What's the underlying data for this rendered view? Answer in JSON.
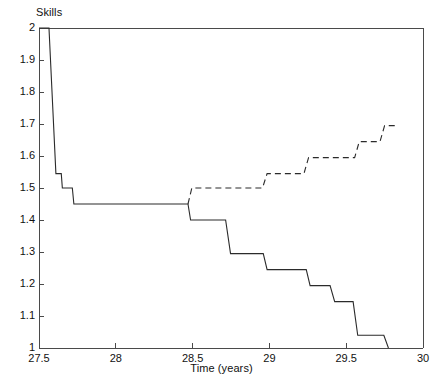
{
  "chart_data": {
    "type": "line",
    "title": "",
    "xlabel": "Time (years)",
    "ylabel": "Skills",
    "xlim": [
      27.5,
      30
    ],
    "ylim": [
      1,
      2
    ],
    "xticks": [
      27.5,
      28,
      28.5,
      29,
      29.5,
      30
    ],
    "xticklabels": [
      "27.5",
      "28",
      "28.5",
      "29",
      "29.5",
      "30"
    ],
    "yticks": [
      1,
      1.1,
      1.2,
      1.3,
      1.4,
      1.5,
      1.6,
      1.7,
      1.8,
      1.9,
      2
    ],
    "yticklabels": [
      "1",
      "1.1",
      "1.2",
      "1.3",
      "1.4",
      "1.5",
      "1.6",
      "1.7",
      "1.8",
      "1.9",
      "2"
    ],
    "grid": false,
    "legend": "none",
    "line_color": "#2b2b2b",
    "axis_color": "#4a4a4a",
    "background": "#ffffff",
    "series": [
      {
        "name": "declining-skills",
        "style": "solid",
        "color": "#2b2b2b",
        "points": [
          [
            27.5,
            2.0
          ],
          [
            27.565,
            2.0
          ],
          [
            27.61,
            1.545
          ],
          [
            27.645,
            1.545
          ],
          [
            27.652,
            1.5
          ],
          [
            27.717,
            1.5
          ],
          [
            27.727,
            1.45
          ],
          [
            28.47,
            1.45
          ],
          [
            28.487,
            1.4
          ],
          [
            28.715,
            1.4
          ],
          [
            28.747,
            1.295
          ],
          [
            28.96,
            1.295
          ],
          [
            28.985,
            1.245
          ],
          [
            29.24,
            1.245
          ],
          [
            29.265,
            1.195
          ],
          [
            29.395,
            1.195
          ],
          [
            29.425,
            1.145
          ],
          [
            29.545,
            1.145
          ],
          [
            29.575,
            1.04
          ],
          [
            29.745,
            1.04
          ],
          [
            29.775,
            1.0
          ]
        ]
      },
      {
        "name": "rising-skills",
        "style": "dashed",
        "color": "#2b2b2b",
        "points": [
          [
            28.47,
            1.45
          ],
          [
            28.495,
            1.5
          ],
          [
            28.955,
            1.5
          ],
          [
            28.985,
            1.545
          ],
          [
            29.225,
            1.545
          ],
          [
            29.255,
            1.595
          ],
          [
            29.555,
            1.595
          ],
          [
            29.585,
            1.645
          ],
          [
            29.72,
            1.645
          ],
          [
            29.75,
            1.695
          ],
          [
            29.82,
            1.695
          ]
        ]
      }
    ]
  },
  "plot_geometry": {
    "left": 39,
    "right": 423,
    "top": 28,
    "bottom": 348
  }
}
